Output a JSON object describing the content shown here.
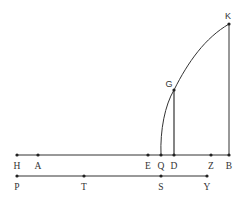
{
  "diagram": {
    "stroke": "#333333",
    "line1": {
      "y": 155,
      "x1": 17,
      "x2": 229,
      "points": [
        {
          "label": "H",
          "x": 17
        },
        {
          "label": "A",
          "x": 38
        },
        {
          "label": "E",
          "x": 148
        },
        {
          "label": "Q",
          "x": 161
        },
        {
          "label": "D",
          "x": 174
        },
        {
          "label": "Z",
          "x": 211
        },
        {
          "label": "B",
          "x": 229
        }
      ]
    },
    "line2": {
      "y": 176,
      "x1": 17,
      "x2": 207,
      "points": [
        {
          "label": "P",
          "x": 17
        },
        {
          "label": "T",
          "x": 84
        },
        {
          "label": "S",
          "x": 161
        },
        {
          "label": "Y",
          "x": 207
        }
      ]
    },
    "upper_points": [
      {
        "label": "K",
        "x": 229,
        "y": 24
      },
      {
        "label": "G",
        "x": 174,
        "y": 90
      }
    ],
    "segments": [
      {
        "name": "KB",
        "from": "K",
        "to": "B"
      },
      {
        "name": "GD",
        "from": "G",
        "to": "D"
      }
    ],
    "arc": {
      "name": "arc-QGK",
      "through": [
        "Q",
        "G",
        "K"
      ]
    }
  }
}
